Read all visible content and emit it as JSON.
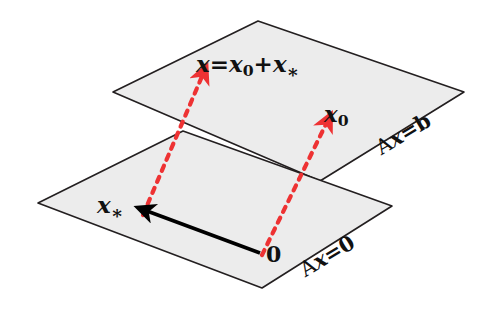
{
  "figure": {
    "colors": {
      "plane_fill": "#ececec",
      "plane_stroke": "#231f20",
      "dashed_vector": "#ee3233",
      "solid_vector": "#000000",
      "background": "#ffffff",
      "text": "#111111"
    }
  },
  "labels": {
    "solution_vector": {
      "x": "x",
      "equals": "=",
      "x0": "x",
      "x0_sub": "0",
      "plus": "+",
      "xstar": "x",
      "xstar_sub": "∗",
      "full": "x=x0+x*"
    },
    "particular_vector": {
      "symbol": "x",
      "subscript": "0",
      "full": "x0"
    },
    "homogeneous_vector": {
      "symbol": "x",
      "subscript": "∗",
      "full": "x*"
    },
    "origin": "0",
    "upper_plane": {
      "lhs": "Ax",
      "eq": "=",
      "rhs": "b",
      "full": "Ax=b"
    },
    "lower_plane": {
      "lhs": "Ax",
      "eq": "=",
      "rhs": "0",
      "full": "Ax=0"
    }
  },
  "geometry": {
    "upper_plane_points": "113,92 258,21 464,92 320,181",
    "lower_plane_points": "38,203 183,131 392,206 262,288",
    "arrow_x0": {
      "from_x": 262,
      "from_y": 255,
      "to_x": 327,
      "to_y": 122,
      "style": "dashed",
      "color": "#ee3233"
    },
    "arrow_x_sum": {
      "from_x": 143,
      "from_y": 215,
      "to_x": 203,
      "to_y": 74,
      "style": "dashed",
      "color": "#ee3233"
    },
    "arrow_xstar": {
      "from_x": 260,
      "from_y": 253,
      "to_x": 147,
      "to_y": 211,
      "style": "solid",
      "color": "#000000"
    }
  }
}
